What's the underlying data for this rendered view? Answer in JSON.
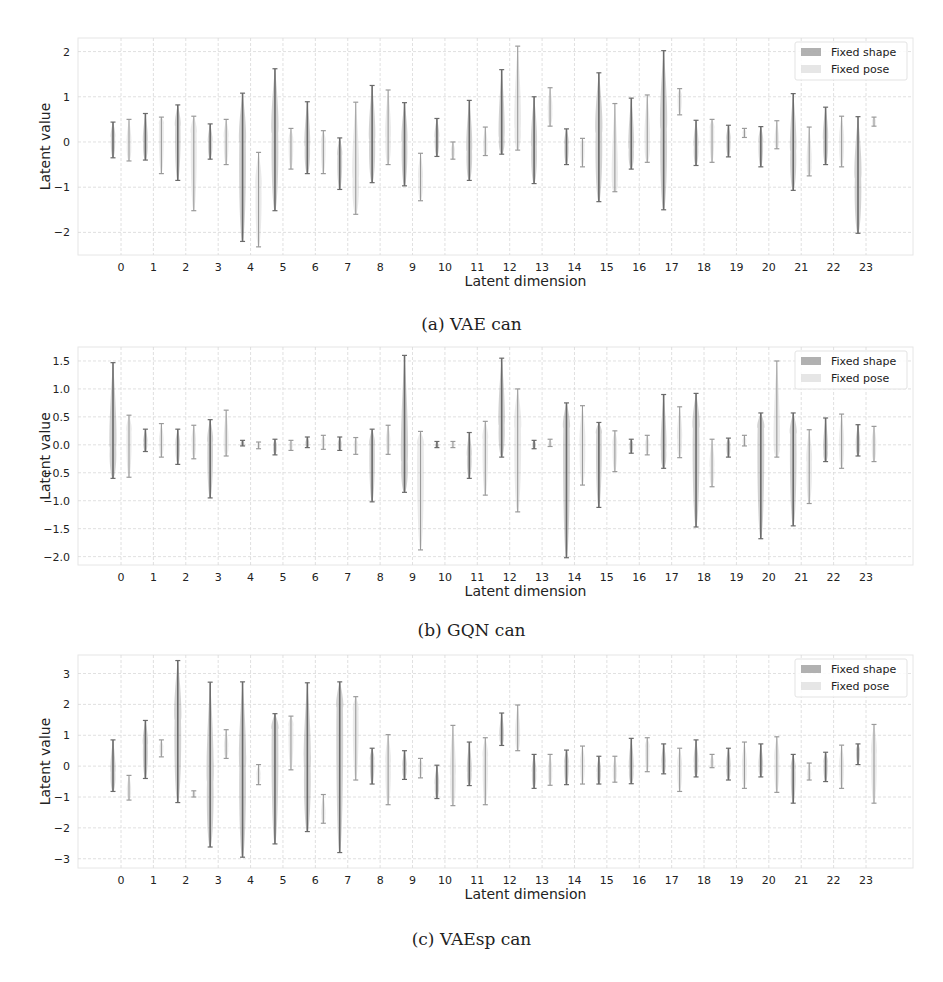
{
  "figure": {
    "captions": [
      "(a) VAE can",
      "(b) GQN can",
      "(c) VAEsp can"
    ]
  },
  "colors": {
    "fixed_shape": "#7d7d7d",
    "fixed_pose": "#b8b8b8",
    "grid": "#d8d8d8",
    "text": "#222222"
  },
  "chart_data": [
    {
      "type": "violin-errorbar",
      "title": "(a) VAE can",
      "xlabel": "Latent dimension",
      "ylabel": "Latent value",
      "ylim": [
        -2.5,
        2.3
      ],
      "yticks": [
        -2,
        -1,
        0,
        1,
        2
      ],
      "ytick_labels": [
        "−2",
        "−1",
        "0",
        "1",
        "2"
      ],
      "categories": [
        "0",
        "1",
        "2",
        "3",
        "4",
        "5",
        "6",
        "7",
        "8",
        "9",
        "10",
        "11",
        "12",
        "13",
        "14",
        "15",
        "16",
        "17",
        "18",
        "19",
        "20",
        "21",
        "22",
        "23"
      ],
      "grid": true,
      "legend": {
        "position": "upper right",
        "entries": [
          "Fixed shape",
          "Fixed pose"
        ]
      },
      "series": [
        {
          "name": "Fixed shape",
          "min": [
            -0.35,
            -0.4,
            -0.85,
            -0.38,
            -2.2,
            -1.52,
            -0.7,
            -1.05,
            -0.9,
            -0.97,
            -0.32,
            -0.85,
            -0.27,
            -0.92,
            -0.5,
            -1.32,
            -0.6,
            -1.5,
            -0.52,
            -0.33,
            -0.55,
            -1.07,
            -0.5,
            -2.02
          ],
          "max": [
            0.44,
            0.63,
            0.82,
            0.4,
            1.08,
            1.62,
            0.89,
            0.09,
            1.25,
            0.87,
            0.52,
            0.92,
            1.6,
            1.0,
            0.29,
            1.53,
            0.97,
            2.02,
            0.48,
            0.37,
            0.34,
            1.07,
            0.77,
            0.56
          ],
          "center": [
            0.1,
            0.0,
            0.35,
            0.0,
            0.0,
            0.2,
            -0.1,
            -0.3,
            0.05,
            0.0,
            0.1,
            -0.2,
            0.1,
            -0.1,
            -0.05,
            0.2,
            -0.15,
            0.3,
            -0.1,
            0.05,
            0.0,
            -0.2,
            0.05,
            -0.8
          ]
        },
        {
          "name": "Fixed pose",
          "min": [
            -0.42,
            -0.7,
            -1.52,
            -0.5,
            -2.32,
            -0.6,
            -0.7,
            -1.6,
            -0.5,
            -1.3,
            -0.38,
            -0.3,
            -0.18,
            0.35,
            -0.55,
            -1.1,
            -0.45,
            0.6,
            -0.45,
            0.1,
            -0.15,
            -0.75,
            -0.55,
            0.35
          ],
          "max": [
            0.5,
            0.55,
            0.57,
            0.5,
            -0.23,
            0.3,
            0.25,
            0.88,
            1.15,
            -0.25,
            0.0,
            0.33,
            2.12,
            1.2,
            0.08,
            0.85,
            1.04,
            1.18,
            0.5,
            0.3,
            0.47,
            0.33,
            0.57,
            0.55
          ],
          "center": [
            -0.05,
            0.4,
            0.2,
            0.1,
            -1.0,
            0.0,
            0.0,
            -0.8,
            0.1,
            -0.8,
            -0.2,
            -0.1,
            0.3,
            0.7,
            -0.1,
            -0.9,
            0.0,
            1.0,
            0.3,
            0.2,
            0.0,
            -0.5,
            0.0,
            0.45
          ]
        }
      ]
    },
    {
      "type": "violin-errorbar",
      "title": "(b) GQN can",
      "xlabel": "Latent dimension",
      "ylabel": "Latent value",
      "ylim": [
        -2.15,
        1.75
      ],
      "yticks": [
        -2.0,
        -1.5,
        -1.0,
        -0.5,
        0.0,
        0.5,
        1.0,
        1.5
      ],
      "ytick_labels": [
        "−2.0",
        "−1.5",
        "−1.0",
        "−0.5",
        "0.0",
        "0.5",
        "1.0",
        "1.5"
      ],
      "categories": [
        "0",
        "1",
        "2",
        "3",
        "4",
        "5",
        "6",
        "7",
        "8",
        "9",
        "10",
        "11",
        "12",
        "13",
        "14",
        "15",
        "16",
        "17",
        "18",
        "19",
        "20",
        "21",
        "22",
        "23"
      ],
      "grid": true,
      "legend": {
        "position": "upper right",
        "entries": [
          "Fixed shape",
          "Fixed pose"
        ]
      },
      "series": [
        {
          "name": "Fixed shape",
          "min": [
            -0.6,
            -0.12,
            -0.35,
            -0.95,
            -0.02,
            -0.18,
            -0.05,
            -0.1,
            -1.02,
            -0.85,
            -0.05,
            -0.6,
            -0.22,
            -0.07,
            -2.02,
            -1.12,
            -0.15,
            -0.42,
            -1.47,
            -0.22,
            -1.68,
            -1.45,
            -0.3,
            -0.2
          ],
          "max": [
            1.47,
            0.28,
            0.28,
            0.45,
            0.08,
            0.1,
            0.14,
            0.14,
            0.28,
            1.6,
            0.06,
            0.22,
            1.55,
            0.08,
            0.75,
            0.4,
            0.1,
            0.9,
            0.92,
            0.12,
            0.57,
            0.57,
            0.48,
            0.36
          ],
          "center": [
            -0.05,
            0.05,
            0.0,
            0.05,
            0.02,
            -0.02,
            0.02,
            0.0,
            0.0,
            -0.3,
            -0.02,
            -0.2,
            0.35,
            0.0,
            0.3,
            0.2,
            0.0,
            -0.1,
            0.3,
            -0.02,
            0.3,
            0.2,
            -0.1,
            0.0
          ],
          "x_positions": [
            0,
            1,
            2,
            3,
            4,
            5,
            6,
            7,
            8,
            9,
            10,
            11,
            12,
            13,
            14,
            15,
            16,
            17,
            18,
            19,
            20,
            21,
            22,
            23
          ]
        },
        {
          "name": "Fixed pose",
          "min": [
            -0.58,
            -0.22,
            -0.25,
            -0.2,
            -0.07,
            -0.1,
            -0.08,
            -0.17,
            -0.17,
            -1.88,
            -0.05,
            -0.9,
            -1.2,
            -0.03,
            -0.72,
            -0.48,
            -0.18,
            -0.23,
            -0.75,
            -0.02,
            -0.22,
            -1.05,
            -0.42,
            -0.3
          ],
          "max": [
            0.53,
            0.38,
            0.35,
            0.62,
            0.05,
            0.08,
            0.17,
            0.13,
            0.35,
            0.24,
            0.06,
            0.42,
            1.0,
            0.1,
            0.7,
            0.25,
            0.17,
            0.68,
            0.1,
            0.17,
            1.5,
            0.27,
            0.55,
            0.33
          ],
          "center": [
            0.25,
            0.05,
            0.05,
            0.0,
            0.0,
            0.0,
            0.05,
            0.0,
            0.05,
            0.0,
            0.0,
            0.1,
            0.3,
            0.0,
            0.0,
            0.0,
            0.0,
            0.1,
            -0.4,
            0.05,
            0.0,
            -0.3,
            0.0,
            0.0
          ]
        }
      ]
    },
    {
      "type": "violin-errorbar",
      "title": "(c) VAEsp can",
      "xlabel": "Latent dimension",
      "ylabel": "Latent value",
      "ylim": [
        -3.3,
        3.6
      ],
      "yticks": [
        -3,
        -2,
        -1,
        0,
        1,
        2,
        3
      ],
      "ytick_labels": [
        "−3",
        "−2",
        "−1",
        "0",
        "1",
        "2",
        "3"
      ],
      "categories": [
        "0",
        "1",
        "2",
        "3",
        "4",
        "5",
        "6",
        "7",
        "8",
        "9",
        "10",
        "11",
        "12",
        "13",
        "14",
        "15",
        "16",
        "17",
        "18",
        "19",
        "20",
        "21",
        "22",
        "23"
      ],
      "grid": true,
      "legend": {
        "position": "upper right",
        "entries": [
          "Fixed shape",
          "Fixed pose"
        ]
      },
      "series": [
        {
          "name": "Fixed shape",
          "min": [
            -0.82,
            -0.4,
            -1.18,
            -2.62,
            -2.95,
            -2.52,
            -2.12,
            -2.8,
            -0.58,
            -0.43,
            -1.05,
            -0.63,
            0.67,
            -0.72,
            -0.6,
            -0.58,
            -0.57,
            -0.25,
            -0.35,
            -0.45,
            -0.35,
            -1.2,
            -0.5,
            0.05
          ],
          "max": [
            0.85,
            1.48,
            3.42,
            2.72,
            2.73,
            1.7,
            2.7,
            2.73,
            0.58,
            0.5,
            0.03,
            0.78,
            1.72,
            0.38,
            0.52,
            0.32,
            0.9,
            0.72,
            0.85,
            0.58,
            0.72,
            0.38,
            0.45,
            0.72
          ],
          "center": [
            -0.2,
            0.7,
            1.5,
            -0.5,
            0.0,
            1.2,
            0.0,
            1.9,
            0.2,
            0.0,
            -0.6,
            -0.2,
            1.0,
            -0.2,
            0.1,
            -0.2,
            -0.1,
            0.1,
            0.1,
            0.0,
            0.0,
            -0.1,
            0.1,
            0.5
          ]
        },
        {
          "name": "Fixed pose",
          "min": [
            -1.1,
            0.3,
            -1.0,
            0.25,
            -0.6,
            -0.12,
            -1.85,
            -0.45,
            -1.25,
            -0.38,
            -1.28,
            -1.25,
            0.5,
            -0.62,
            -0.58,
            -0.52,
            -0.18,
            -0.82,
            -0.05,
            -0.72,
            -0.85,
            -0.45,
            -0.72,
            -1.2
          ],
          "max": [
            -0.3,
            0.85,
            -0.8,
            1.18,
            0.05,
            1.62,
            -0.92,
            2.25,
            1.02,
            0.25,
            1.32,
            0.92,
            1.98,
            0.38,
            0.65,
            0.32,
            0.92,
            0.58,
            0.38,
            0.78,
            0.95,
            0.1,
            0.68,
            1.35
          ],
          "center": [
            -0.8,
            0.6,
            -0.9,
            0.6,
            -0.3,
            1.3,
            -1.6,
            1.8,
            0.1,
            0.0,
            -0.3,
            0.3,
            1.0,
            -0.2,
            0.1,
            -0.2,
            0.6,
            0.0,
            0.1,
            0.0,
            0.2,
            -0.3,
            0.0,
            0.4
          ]
        }
      ]
    }
  ]
}
